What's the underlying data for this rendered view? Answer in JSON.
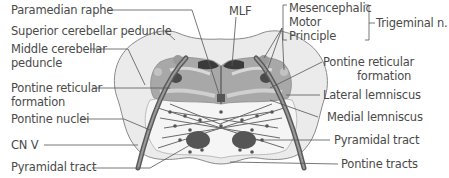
{
  "figure": {
    "colors": {
      "outline": "#8a8a8a",
      "light_fill": "#e6e6e6",
      "mid_fill": "#b0b0b0",
      "dark_fill": "#6a6a6a",
      "darkest": "#3a3a3a",
      "text": "#4a4a4a",
      "leader": "#555555"
    }
  },
  "labels": {
    "left": [
      {
        "text": "Paramedian raphe"
      },
      {
        "text": "Superior cerebellar peduncle"
      },
      {
        "text": "Middle cerebellar",
        "text2": "peduncle"
      },
      {
        "text": "Pontine reticular",
        "text2": "formation"
      },
      {
        "text": "Pontine nuclei"
      },
      {
        "text": "CN V"
      },
      {
        "text": "Pyramidal tract"
      }
    ],
    "top": {
      "text": "MLF"
    },
    "trigeminal_group": {
      "items": [
        "Mesencephalic",
        "Motor",
        "Principle"
      ],
      "group_label": "Trigeminal n."
    },
    "right": [
      {
        "text": "Pontine reticular",
        "text2": "formation"
      },
      {
        "text": "Lateral lemniscus"
      },
      {
        "text": "Medial lemniscus"
      },
      {
        "text": "Pyramidal tract"
      },
      {
        "text": "Pontine tracts"
      }
    ]
  }
}
